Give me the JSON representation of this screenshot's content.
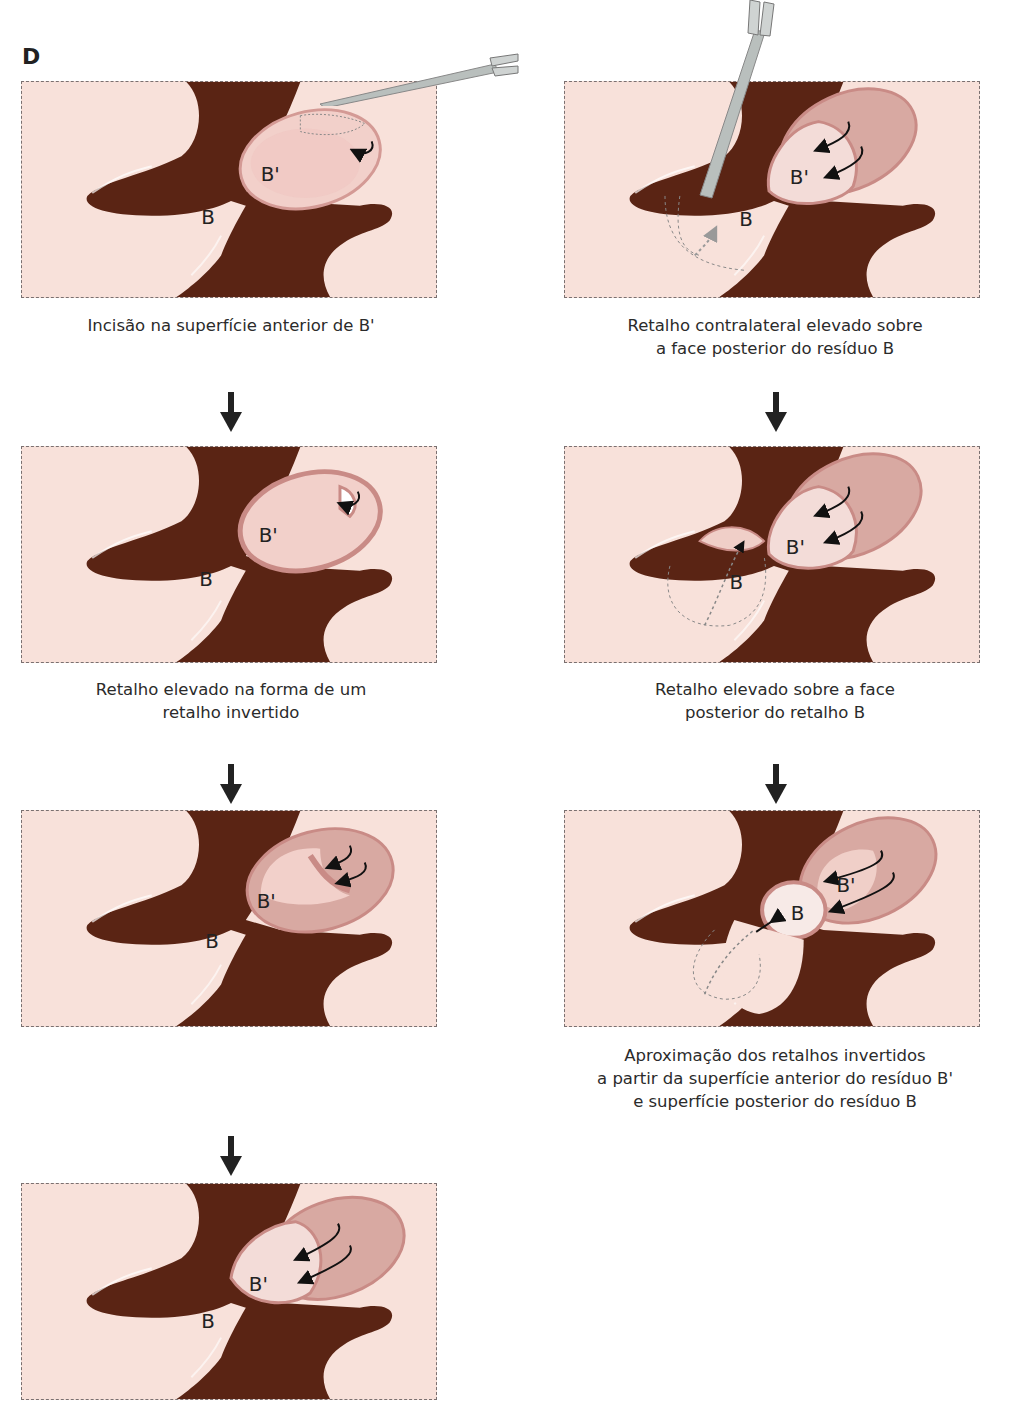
{
  "figure": {
    "panel_label": "D",
    "colors": {
      "background": "#f8e1da",
      "cartilage": "#5a2414",
      "flap": "#f0cfc8",
      "flap_edge": "#c98b86",
      "border": "#7a7070"
    }
  },
  "panels": [
    {
      "id": "left-1",
      "step": 1,
      "caption": "Incisão na superfície anterior de B'",
      "labels": {
        "a": "B'",
        "b": "B"
      }
    },
    {
      "id": "left-2",
      "step": 2,
      "caption": "Retalho elevado na forma de um\nretalho invertido",
      "labels": {
        "a": "B'",
        "b": "B"
      }
    },
    {
      "id": "left-3",
      "step": 3,
      "caption": "",
      "labels": {
        "a": "B'",
        "b": "B"
      }
    },
    {
      "id": "left-4",
      "step": 4,
      "caption": "",
      "labels": {
        "a": "B'",
        "b": "B"
      }
    },
    {
      "id": "right-1",
      "step": 1,
      "caption": "Retalho contralateral elevado sobre\na face posterior do resíduo B",
      "labels": {
        "a": "B'",
        "b": "B"
      }
    },
    {
      "id": "right-2",
      "step": 2,
      "caption": "Retalho elevado sobre a face\nposterior do retalho B",
      "labels": {
        "a": "B'",
        "b": "B"
      }
    },
    {
      "id": "right-3",
      "step": 3,
      "caption": "Aproximação dos retalhos invertidos\na partir da superfície anterior do resíduo B'\ne superfície posterior do resíduo B",
      "labels": {
        "a": "B'",
        "b": "B"
      }
    }
  ],
  "icons": {
    "step_arrow": "down-arrow-icon",
    "forceps": "forceps-icon",
    "rotation_arrow": "curved-arrow-icon"
  }
}
